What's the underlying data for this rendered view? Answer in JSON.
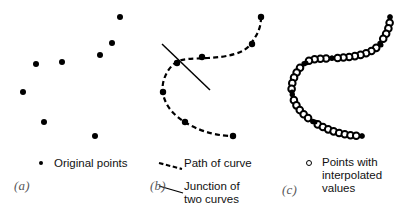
{
  "figure": {
    "background_color": "#ffffff",
    "ink_color": "#000000",
    "tag_color": "#58585a"
  },
  "panels": [
    {
      "tag": "(a)",
      "tag_pos": [
        14,
        178
      ],
      "legend": [
        {
          "key": "filled-dot",
          "label": "Original points",
          "key_pos": [
            41,
            164
          ],
          "label_pos": [
            55,
            157
          ]
        }
      ],
      "marker_style": "filled-dot",
      "marker_radius": 3.0,
      "points": [
        [
          36,
          64
        ],
        [
          62,
          62
        ],
        [
          100,
          55
        ],
        [
          112,
          43
        ],
        [
          120,
          17
        ],
        [
          23,
          92
        ],
        [
          44,
          122
        ],
        [
          95,
          136
        ]
      ]
    },
    {
      "tag": "(b)",
      "tag_pos": [
        10,
        178
      ],
      "legend": [
        {
          "key": "dashed-line",
          "label": "Path of curve",
          "key_pos": [
            31,
            163
          ],
          "label_pos": [
            62,
            157
          ]
        },
        {
          "key": "solid-line",
          "label": "Junction of\ntwo curves",
          "key_pos": [
            31,
            186
          ],
          "label_pos": [
            62,
            180
          ]
        }
      ],
      "marker_style": "filled-dot",
      "marker_radius": 3.2,
      "points": [
        [
          37,
          63
        ],
        [
          62,
          57
        ],
        [
          112,
          44
        ],
        [
          121,
          17
        ],
        [
          23,
          92
        ],
        [
          45,
          122
        ],
        [
          93,
          136
        ]
      ],
      "curve_path": "M 121 17 C 121 30, 116 36, 110 45 C 103 54, 86 57, 68 58 C 52 59, 41 58, 35 63 C 26 70, 21 83, 23 93 C 25 106, 34 116, 48 124 C 64 133, 80 136, 93 136",
      "junction_line": [
        [
          22,
          44
        ],
        [
          70,
          90
        ]
      ]
    },
    {
      "tag": "(c)",
      "tag_pos": [
        12,
        182
      ],
      "legend": [
        {
          "key": "open-ring",
          "label": "Points with\ninterpolated\nvalues",
          "key_pos": [
            39,
            163
          ],
          "label_pos": [
            60,
            156
          ]
        }
      ],
      "marker_style": "open-ring",
      "marker_radius": 3.3,
      "anchor_points": [
        [
          120,
          17
        ],
        [
          111,
          45
        ],
        [
          62,
          58
        ],
        [
          36,
          63
        ],
        [
          22,
          92
        ],
        [
          45,
          122
        ],
        [
          92,
          136
        ]
      ],
      "curve_path": "M 120 17 C 120 30, 115 36, 109 45 C 102 54, 85 57, 67 58 C 51 59, 41 58, 35 63 C 26 70, 20 83, 22 93 C 24 106, 33 116, 47 124 C 63 133, 79 136, 92 136",
      "interpolated_count": 40
    }
  ],
  "chart_data": {
    "type": "scatter",
    "xlabel": "",
    "ylabel": "",
    "series": [
      {
        "name": "Original points",
        "panel": "(a)",
        "marker": "filled-dot",
        "x": [
          36,
          62,
          100,
          112,
          120,
          23,
          44,
          95
        ],
        "y": [
          64,
          62,
          55,
          43,
          17,
          92,
          122,
          136
        ]
      },
      {
        "name": "Path of curve",
        "panel": "(b)",
        "marker": "dashed-line"
      },
      {
        "name": "Junction of two curves",
        "panel": "(b)",
        "marker": "solid-line"
      },
      {
        "name": "Points with interpolated values",
        "panel": "(c)",
        "marker": "open-ring"
      }
    ],
    "grid": false,
    "legend": "bottom"
  }
}
